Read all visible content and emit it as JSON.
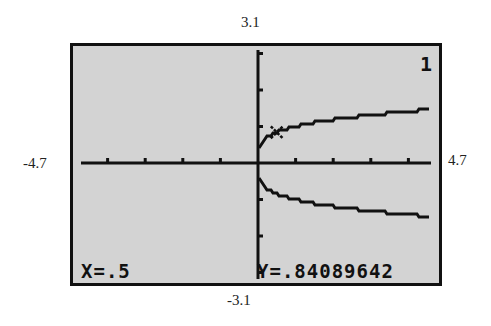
{
  "window": {
    "xmin": "-4.7",
    "xmax": "4.7",
    "ymin": "-3.1",
    "ymax": "3.1"
  },
  "screen": {
    "equation_number": "1",
    "trace_x": "X=.5",
    "trace_y": "Y=.84089642",
    "background_color": "#d3d3d3",
    "ink_color": "#111111"
  },
  "chart_data": {
    "type": "line",
    "title": "",
    "xlabel": "",
    "ylabel": "",
    "xlim": [
      -4.7,
      4.7
    ],
    "ylim": [
      -3.1,
      3.1
    ],
    "grid": false,
    "x_ticks_step": 1,
    "y_ticks_step": 1,
    "series": [
      {
        "name": "upper branch y = x^(1/4)",
        "x": [
          0,
          0.5,
          1,
          2,
          3,
          4,
          4.7
        ],
        "y": [
          0,
          0.84,
          1.0,
          1.19,
          1.32,
          1.41,
          1.47
        ]
      },
      {
        "name": "lower branch y = -x^(1/4)",
        "x": [
          0,
          0.5,
          1,
          2,
          3,
          4,
          4.7
        ],
        "y": [
          0,
          -0.84,
          -1.0,
          -1.19,
          -1.32,
          -1.41,
          -1.47
        ]
      }
    ],
    "annotations": [
      {
        "type": "trace-cursor",
        "x": 0.5,
        "y": 0.84089642
      },
      {
        "type": "text",
        "text": "X=.5"
      },
      {
        "type": "text",
        "text": "Y=.84089642"
      }
    ]
  }
}
